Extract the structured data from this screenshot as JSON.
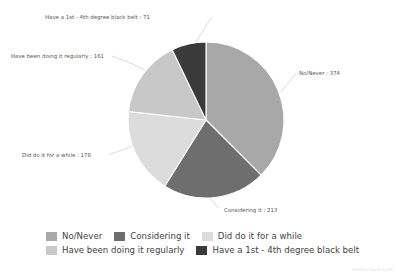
{
  "chart_data": {
    "type": "pie",
    "title": "",
    "subtitle": "",
    "xlabel": "",
    "ylabel": "",
    "grid": false,
    "legend_position": "bottom",
    "total": 997,
    "categories": [
      "No/Never",
      "Considering it",
      "Did do it for a while",
      "Have been doing it regularly",
      "Have a 1st - 4th degree black belt"
    ],
    "values": [
      374,
      213,
      178,
      161,
      71
    ],
    "colors": [
      "#a8a8a8",
      "#6e6e6e",
      "#dcdcdc",
      "#c8c8c8",
      "#3a3a3a"
    ],
    "slices": [
      {
        "label": "No/Never",
        "value": 374,
        "color": "#a8a8a8",
        "annotation": "No/Never : 374"
      },
      {
        "label": "Considering it",
        "value": 213,
        "color": "#6e6e6e",
        "annotation": "Considering it : 213"
      },
      {
        "label": "Did do it for a while",
        "value": 178,
        "color": "#dcdcdc",
        "annotation": "Did do it for a while : 178"
      },
      {
        "label": "Have been doing it regularly",
        "value": 161,
        "color": "#c8c8c8",
        "annotation": "Have been doing it regularly : 161"
      },
      {
        "label": "Have a 1st - 4th degree black belt",
        "value": 71,
        "color": "#3a3a3a",
        "annotation": "Have a 1st - 4th degree black belt : 71"
      }
    ]
  },
  "legend": {
    "rows": [
      [
        {
          "label": "No/Never",
          "color": "#a8a8a8"
        },
        {
          "label": "Considering it",
          "color": "#6e6e6e"
        },
        {
          "label": "Did do it for a while",
          "color": "#dcdcdc"
        }
      ],
      [
        {
          "label": "Have been doing it regularly",
          "color": "#c8c8c8"
        },
        {
          "label": "Have a 1st - 4th degree black belt",
          "color": "#3a3a3a"
        }
      ]
    ]
  },
  "watermark": {
    "text": "meta-chart.com"
  }
}
